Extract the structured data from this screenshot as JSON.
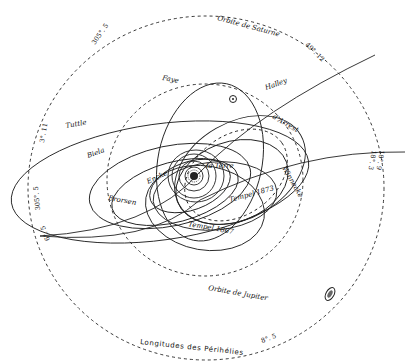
{
  "diagram": {
    "title": "Longitudes des Périhélies",
    "center_label": "Le Soleil",
    "earth_label": "la Terre",
    "orbits": {
      "saturn": "Orbite de Saturne",
      "jupiter": "Orbite de Jupiter"
    },
    "comets": [
      {
        "name": "Faye"
      },
      {
        "name": "Halley"
      },
      {
        "name": "d'Arrest"
      },
      {
        "name": "Tuttle"
      },
      {
        "name": "Biela"
      },
      {
        "name": "Brorsen"
      },
      {
        "name": "Encke"
      },
      {
        "name": "Tempel 1867"
      },
      {
        "name": "Tempel 1873"
      },
      {
        "name": "Winnecke"
      }
    ],
    "degree_labels": {
      "top_left": "305°. 5",
      "top_right": "49°. 12",
      "right_upper": "18°. 9",
      "right_mid": "18°. 3",
      "left_upper": "3°. 11",
      "left_mid": "305°. 5",
      "left_lower": "6°. 5",
      "bottom_right": "8°. 5"
    },
    "symbols": {
      "saturn_symbol": "saturn-icon",
      "planet_marker": "uranus-icon",
      "sun_symbol": "sun-icon"
    },
    "colors": {
      "ink": "#222222",
      "paper": "#ffffff"
    }
  }
}
